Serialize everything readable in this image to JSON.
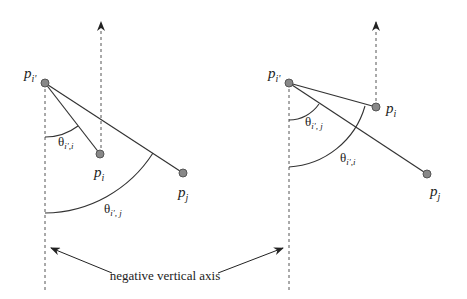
{
  "figure": {
    "left_panel": {
      "points": {
        "p_iprime": {
          "label": "p",
          "sub": "i'",
          "x": 45,
          "y": 83
        },
        "p_i": {
          "label": "p",
          "sub": "i",
          "x": 100,
          "y": 154
        },
        "p_j": {
          "label": "p",
          "sub": "j",
          "x": 183,
          "y": 173
        }
      },
      "angles": [
        {
          "label": "θ",
          "sub": "i',i"
        },
        {
          "label": "θ",
          "sub": "i', j"
        }
      ]
    },
    "right_panel": {
      "points": {
        "p_iprime": {
          "label": "p",
          "sub": "i'",
          "x": 289,
          "y": 83
        },
        "p_i": {
          "label": "p",
          "sub": "i",
          "x": 376,
          "y": 107
        },
        "p_j": {
          "label": "p",
          "sub": "j",
          "x": 427,
          "y": 174
        }
      },
      "angles": [
        {
          "label": "θ",
          "sub": "i', j"
        },
        {
          "label": "θ",
          "sub": "i',i"
        }
      ]
    },
    "caption": "negative vertical axis",
    "colors": {
      "line": "#333333",
      "point_fill": "#888888",
      "point_stroke": "#555555"
    }
  }
}
